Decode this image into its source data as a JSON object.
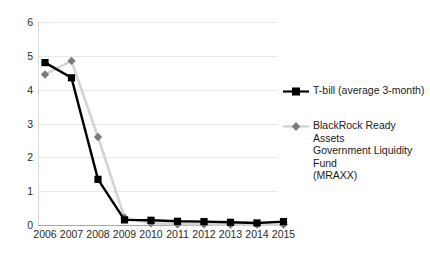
{
  "chart_data": {
    "type": "line",
    "title": "",
    "xlabel": "",
    "ylabel": "",
    "x": [
      2006,
      2007,
      2008,
      2009,
      2010,
      2011,
      2012,
      2013,
      2014,
      2015
    ],
    "categories": [
      "2006",
      "2007",
      "2008",
      "2009",
      "2010",
      "2011",
      "2012",
      "2013",
      "2014",
      "2015"
    ],
    "xlim": [
      2006,
      2015
    ],
    "ylim": [
      0,
      6
    ],
    "y_ticks": [
      0,
      1,
      2,
      3,
      4,
      5,
      6
    ],
    "y_tick_labels": [
      "0",
      "1",
      "2",
      "3",
      "4",
      "5",
      "6"
    ],
    "grid": "horizontal",
    "legend_position": "right",
    "series": [
      {
        "name": "T-bill (average 3-month)",
        "color": "#000000",
        "marker": "square",
        "marker_color": "#000000",
        "values": [
          4.8,
          4.35,
          1.35,
          0.15,
          0.14,
          0.11,
          0.1,
          0.08,
          0.06,
          0.1
        ]
      },
      {
        "name": "BlackRock Ready Assets Government Liquidity Fund (MRAXX)",
        "color": "#d4d4d4",
        "marker": "diamond",
        "marker_color": "#7a7a7a",
        "values": [
          4.45,
          4.85,
          2.6,
          0.22,
          0.05,
          0.02,
          0.02,
          0.01,
          0.01,
          0.01
        ]
      }
    ]
  },
  "legend": {
    "entries": [
      {
        "label": "T-bill (average 3-month)"
      },
      {
        "label": "BlackRock Ready Assets Government Liquidity Fund (MRAXX)"
      }
    ],
    "mraxx_line1": "BlackRock Ready Assets",
    "mraxx_line2": "Government Liquidity Fund",
    "mraxx_line3": "(MRAXX)"
  }
}
